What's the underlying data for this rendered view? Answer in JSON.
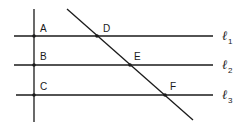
{
  "diagram": {
    "points": {
      "A": {
        "label": "A",
        "x": 34,
        "y": 36
      },
      "B": {
        "label": "B",
        "x": 34,
        "y": 65
      },
      "C": {
        "label": "C",
        "x": 34,
        "y": 95
      },
      "D": {
        "label": "D",
        "x": 97,
        "y": 36
      },
      "E": {
        "label": "E",
        "x": 130,
        "y": 65
      },
      "F": {
        "label": "F",
        "x": 165,
        "y": 95
      }
    },
    "lines": [
      {
        "name": "l1",
        "symbol": "ℓ",
        "subscript": "1",
        "y": 36
      },
      {
        "name": "l2",
        "symbol": "ℓ",
        "subscript": "2",
        "y": 65
      },
      {
        "name": "l3",
        "symbol": "ℓ",
        "subscript": "3",
        "y": 95
      }
    ],
    "labels": {
      "A": "A",
      "B": "B",
      "C": "C",
      "D": "D",
      "E": "E",
      "F": "F",
      "l1_symbol": "ℓ",
      "l1_sub": "1",
      "l2_symbol": "ℓ",
      "l2_sub": "2",
      "l3_symbol": "ℓ",
      "l3_sub": "3"
    },
    "colors": {
      "ink": "#1a1a1a",
      "background": "#ffffff"
    }
  }
}
